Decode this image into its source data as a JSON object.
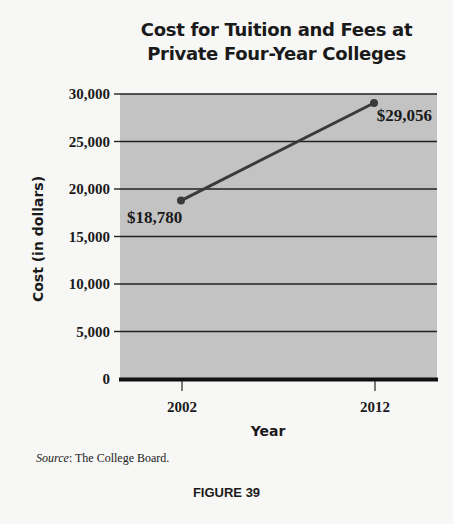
{
  "chart_data": {
    "type": "line",
    "title": "Cost for Tuition and Fees at Private Four-Year Colleges",
    "title_lines": [
      "Cost for Tuition and Fees at",
      "Private Four-Year Colleges"
    ],
    "xlabel": "Year",
    "ylabel": "Cost (in dollars)",
    "x": [
      "2002",
      "2012"
    ],
    "series": [
      {
        "name": "Cost for Tuition and Fees",
        "values": [
          18780,
          29056
        ]
      }
    ],
    "data_labels": [
      "$18,780",
      "$29,056"
    ],
    "y_ticks": [
      "0",
      "5,000",
      "10,000",
      "15,000",
      "20,000",
      "25,000",
      "30,000"
    ],
    "ylim": [
      0,
      30000
    ],
    "grid": true,
    "legend": "none",
    "plot_background": "#c3c3c3",
    "line_color": "#3a3a3a"
  },
  "caption": {
    "source_label": "Source",
    "source_text": ": The College Board.",
    "figure_label": "FIGURE 39"
  }
}
